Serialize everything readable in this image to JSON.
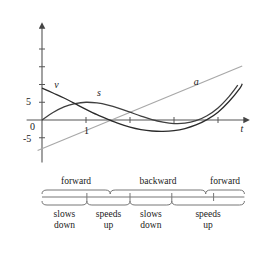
{
  "chart_data": {
    "type": "line",
    "title": "",
    "xlabel": "t",
    "ylabel": "",
    "grid": false,
    "legend_position": "inline-curve-labels",
    "xlim": [
      -0.35,
      4.6
    ],
    "ylim": [
      -12,
      26
    ],
    "x_ticks": [
      1,
      2,
      3,
      4
    ],
    "x_tick_labels": [
      "1",
      "",
      "",
      ""
    ],
    "y_ticks": [
      -5,
      0,
      5,
      10,
      15,
      20
    ],
    "y_tick_labels": [
      "-5",
      "0",
      "5",
      "",
      "",
      ""
    ],
    "series": [
      {
        "name": "s",
        "role": "position",
        "color": "#3f3f3f",
        "label": "s",
        "label_x": 1.25,
        "label_y": 7.2,
        "points": [
          [
            0,
            0
          ],
          [
            0.25,
            2.1
          ],
          [
            0.5,
            3.7
          ],
          [
            0.75,
            4.6
          ],
          [
            1,
            5.0
          ],
          [
            1.25,
            4.8
          ],
          [
            1.5,
            4.2
          ],
          [
            1.75,
            3.3
          ],
          [
            2,
            2.2
          ],
          [
            2.25,
            1.1
          ],
          [
            2.5,
            0.1
          ],
          [
            2.75,
            -0.6
          ],
          [
            3,
            -1.0
          ],
          [
            3.25,
            -0.9
          ],
          [
            3.5,
            -0.2
          ],
          [
            3.75,
            1.2
          ],
          [
            4,
            3.4
          ],
          [
            4.25,
            6.6
          ],
          [
            4.45,
            9.8
          ]
        ]
      },
      {
        "name": "v",
        "role": "velocity",
        "color": "#2b2b2b",
        "label": "v",
        "label_x": 0.28,
        "label_y": 9.5,
        "points": [
          [
            0,
            9.0
          ],
          [
            0.25,
            7.6
          ],
          [
            0.5,
            6.2
          ],
          [
            0.75,
            4.6
          ],
          [
            1,
            3.0
          ],
          [
            1.25,
            1.5
          ],
          [
            1.5,
            0.2
          ],
          [
            1.75,
            -1.0
          ],
          [
            2,
            -2.0
          ],
          [
            2.25,
            -2.7
          ],
          [
            2.5,
            -3.1
          ],
          [
            2.75,
            -3.2
          ],
          [
            3,
            -3.0
          ],
          [
            3.25,
            -2.4
          ],
          [
            3.5,
            -1.4
          ],
          [
            3.75,
            0.1
          ],
          [
            4,
            2.2
          ],
          [
            4.25,
            5.2
          ],
          [
            4.5,
            9.0
          ],
          [
            4.55,
            10.2
          ]
        ]
      },
      {
        "name": "a",
        "role": "acceleration",
        "color": "#a8a8a8",
        "label": "a",
        "label_x": 3.45,
        "label_y": 10.5,
        "points": [
          [
            -0.1,
            -8.6
          ],
          [
            4.55,
            15.2
          ]
        ]
      }
    ],
    "zero_crossings": {
      "s": [
        0,
        2.55,
        3.55
      ],
      "v": [
        1.55,
        3.72
      ],
      "a": [
        1.58
      ]
    }
  },
  "annotations": {
    "axis_label_t": "t",
    "y_labels": [
      "5",
      "0",
      "-5"
    ],
    "x_label_one": "1",
    "curve_labels": {
      "v": "v",
      "s": "s",
      "a": "a"
    }
  },
  "direction_bands": {
    "row_label": "direction of motion",
    "items": [
      {
        "label": "forward",
        "start_t": 0,
        "end_t": 1.55
      },
      {
        "label": "backward",
        "start_t": 1.55,
        "end_t": 3.72
      },
      {
        "label": "forward",
        "start_t": 3.72,
        "end_t": 4.6
      }
    ]
  },
  "speed_bands": {
    "row_label": "change in speed",
    "items": [
      {
        "line1": "slows",
        "line2": "down",
        "start_t": 0,
        "end_t": 1.02
      },
      {
        "line1": "speeds",
        "line2": "up",
        "start_t": 1.02,
        "end_t": 2.0
      },
      {
        "line1": "slows",
        "line2": "down",
        "start_t": 2.0,
        "end_t": 2.95
      },
      {
        "line1": "speeds",
        "line2": "up",
        "start_t": 2.95,
        "end_t": 4.6
      }
    ]
  },
  "timeline": {
    "tick_positions": [
      1.02,
      2.0,
      2.95,
      3.9
    ],
    "start_t": 0,
    "end_t": 4.6
  },
  "colors": {
    "axis": "#555555",
    "position_curve": "#3f3f3f",
    "velocity_curve": "#2b2b2b",
    "acceleration_line": "#a8a8a8",
    "bracket": "#777777",
    "text": "#1a1a1a"
  }
}
